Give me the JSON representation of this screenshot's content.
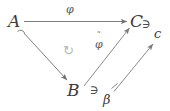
{
  "figure": {
    "type": "commutative-diagram",
    "background_color": "#ffffff",
    "ink_color": "#3c3c3c",
    "label_color": "#555555"
  },
  "objects": {
    "a": "A",
    "b": "B",
    "c_upper": "C"
  },
  "elements": {
    "c_lower": "c",
    "beta": "β"
  },
  "membership": {
    "c_in_C": "∋",
    "beta_in_B": "∋"
  },
  "morphisms": {
    "phi": "φ",
    "phi_tilde_base": "φ",
    "phi_tilde_accent": "˜",
    "inclusion_hook": "hook-arrow"
  },
  "markers": {
    "commutes": "↻"
  },
  "arrows": [
    {
      "name": "arrow-a-to-c",
      "from": "A",
      "to": "C",
      "label": "φ",
      "style": "plain",
      "direction": "horizontal-right"
    },
    {
      "name": "arrow-a-to-b",
      "from": "A",
      "to": "B",
      "label": "",
      "style": "hooked-inclusion",
      "direction": "diagonal-down-right"
    },
    {
      "name": "arrow-b-to-c",
      "from": "B",
      "to": "C",
      "label": "φ̃",
      "style": "plain",
      "direction": "diagonal-up-right"
    },
    {
      "name": "arrow-beta-to-c-elem",
      "from": "β",
      "to": "c",
      "label": "",
      "style": "bar-tail",
      "direction": "diagonal-up-right"
    }
  ]
}
